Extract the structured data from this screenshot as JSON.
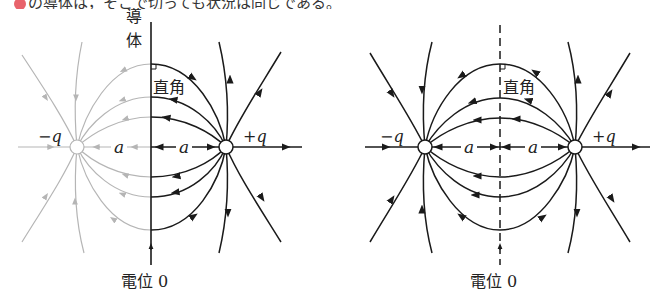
{
  "header": {
    "text": "の導体は，そこで切っても状況は同じである。",
    "bullet_color": "#e8636b"
  },
  "colors": {
    "line": "#1a1a1a",
    "ghost_line": "#b5b5b5"
  },
  "left_figure": {
    "conductor_label": "導体",
    "right_angle_label": "直角",
    "potential_label": "電位 0",
    "negative_charge_label": "−q",
    "positive_charge_label": "+q",
    "distance_left_label": "a",
    "distance_right_label": "a"
  },
  "right_figure": {
    "right_angle_label": "直角",
    "potential_label": "電位 0",
    "negative_charge_label": "−q",
    "positive_charge_label": "+q",
    "distance_left_label": "a",
    "distance_right_label": "a"
  }
}
